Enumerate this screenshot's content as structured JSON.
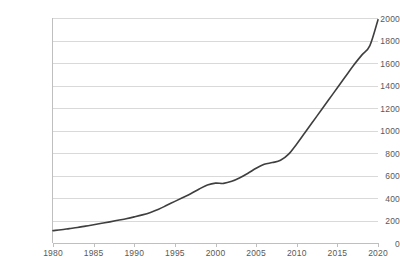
{
  "chart_data": {
    "type": "line",
    "title": "",
    "subtitle": "",
    "xlabel": "",
    "ylabel": "",
    "grid": "horizontal",
    "legend": "none",
    "xlim": [
      1980,
      2020
    ],
    "ylim": [
      0,
      2000
    ],
    "y_ticks": [
      0,
      200,
      400,
      600,
      800,
      1000,
      1200,
      1400,
      1600,
      1800,
      2000
    ],
    "y_tick_labels": [
      "0",
      "200",
      "400",
      "600",
      "800",
      "1000",
      "1200",
      "1400",
      "1600",
      "1800",
      "2000"
    ],
    "x_ticks": [
      1980,
      1985,
      1990,
      1995,
      2000,
      2005,
      2010,
      2015,
      2020
    ],
    "x_tick_labels": [
      "1980",
      "1985",
      "1990",
      "1995",
      "2000",
      "2005",
      "2010",
      "2015",
      "2020"
    ],
    "series": [
      {
        "name": "series-1",
        "color": "#3f3f3f",
        "x": [
          1980,
          1981,
          1982,
          1983,
          1984,
          1985,
          1986,
          1987,
          1988,
          1989,
          1990,
          1991,
          1992,
          1993,
          1994,
          1995,
          1996,
          1997,
          1998,
          1999,
          2000,
          2001,
          2002,
          2003,
          2004,
          2005,
          2006,
          2007,
          2008,
          2009,
          2010,
          2011,
          2012,
          2013,
          2014,
          2015,
          2016,
          2017,
          2018,
          2019,
          2020
        ],
        "values": [
          110,
          118,
          128,
          138,
          150,
          162,
          175,
          188,
          202,
          216,
          232,
          250,
          272,
          300,
          335,
          370,
          405,
          440,
          480,
          515,
          532,
          530,
          548,
          580,
          620,
          665,
          700,
          715,
          735,
          790,
          880,
          980,
          1080,
          1180,
          1280,
          1380,
          1480,
          1580,
          1670,
          1755,
          1985
        ]
      }
    ]
  },
  "axes": {
    "y_tick_labels": [
      "2000",
      "1800",
      "1600",
      "1400",
      "1200",
      "1000",
      "800",
      "600",
      "400",
      "200",
      "0"
    ],
    "x_tick_labels": [
      "1980",
      "1985",
      "1990",
      "1995",
      "2000",
      "2005",
      "2010",
      "2015",
      "2020"
    ]
  }
}
